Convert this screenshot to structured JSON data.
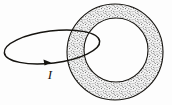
{
  "figure": {
    "name": "current-loop-linking-toroid",
    "background_color": "#fdfdfd",
    "stroke_color": "#15130f",
    "stipple_color": "#4a4a4a",
    "stipple_background": "#f2f2f2",
    "labels": {
      "current": "I"
    },
    "toroid": {
      "outer_circle": {
        "cx": 115,
        "cy": 52,
        "r": 48
      },
      "inner_circle": {
        "cx": 116,
        "cy": 50,
        "r": 32
      },
      "fill": "stipple"
    },
    "loop": {
      "cx": 52,
      "cy": 47,
      "rx": 48,
      "ry": 16,
      "rotation_deg": -7
    },
    "arrow": {
      "tip_x": 51,
      "tip_y": 62.5,
      "direction": "right",
      "label": "I",
      "label_x": 50,
      "label_y": 79
    }
  }
}
